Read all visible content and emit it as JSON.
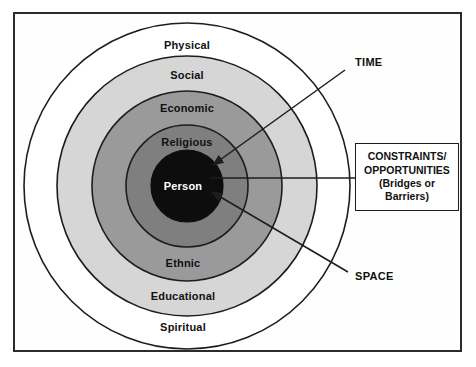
{
  "diagram": {
    "frame": {
      "border_color": "#2b2b2b",
      "background": "#fefefe"
    },
    "center": {
      "x": 187,
      "y": 186
    },
    "rings": [
      {
        "name": "physical-spiritual-ring",
        "top_label": "Physical",
        "bottom_label": "Spiritual",
        "radius": 163,
        "fill": "#ffffff",
        "stroke": "#1d1d1d",
        "label_color": "#111111"
      },
      {
        "name": "social-educational-ring",
        "top_label": "Social",
        "bottom_label": "Educational",
        "radius": 130,
        "fill": "#d6d6d6",
        "stroke": "#1d1d1d",
        "label_color": "#111111"
      },
      {
        "name": "economic-ethnic-ring",
        "top_label": "Economic",
        "bottom_label": "Ethnic",
        "radius": 95,
        "fill": "#9a9a9a",
        "stroke": "#1d1d1d",
        "label_color": "#111111"
      },
      {
        "name": "religious-ring",
        "top_label": "Religious",
        "bottom_label": "",
        "radius": 61,
        "fill": "#807f80",
        "stroke": "#1d1d1d",
        "label_color": "#111111"
      },
      {
        "name": "person-core",
        "top_label": "Person",
        "bottom_label": "",
        "radius": 36,
        "fill": "#0d0d0d",
        "stroke": "#0d0d0d",
        "label_color": "#ffffff"
      }
    ],
    "ring_label_positions": {
      "physical": {
        "x": 187,
        "y": 45
      },
      "social": {
        "x": 187,
        "y": 75
      },
      "economic": {
        "x": 187,
        "y": 108
      },
      "religious": {
        "x": 187,
        "y": 142
      },
      "person": {
        "x": 183,
        "y": 186
      },
      "ethnic": {
        "x": 183,
        "y": 263
      },
      "educational": {
        "x": 183,
        "y": 296
      },
      "spiritual": {
        "x": 183,
        "y": 327
      }
    },
    "annotations": [
      {
        "name": "time-annotation",
        "label": "TIME",
        "label_x": 355,
        "label_y": 63,
        "line": {
          "x1": 345,
          "y1": 70,
          "x2": 213,
          "y2": 165
        },
        "arrowhead": true
      },
      {
        "name": "space-annotation",
        "label": "SPACE",
        "label_x": 355,
        "label_y": 277,
        "line": {
          "x1": 348,
          "y1": 272,
          "x2": 212,
          "y2": 192
        },
        "arrowhead": true
      },
      {
        "name": "constraints-connector",
        "label": "",
        "line": {
          "x1": 355,
          "y1": 178,
          "x2": 210,
          "y2": 178
        },
        "arrowhead": false
      }
    ],
    "constraints_box": {
      "name": "constraints-opportunities-box",
      "lines": [
        "CONSTRAINTS/",
        "OPPORTUNITIES",
        "(Bridges or",
        "Barriers)"
      ],
      "border_color": "#1d1d1d"
    }
  }
}
